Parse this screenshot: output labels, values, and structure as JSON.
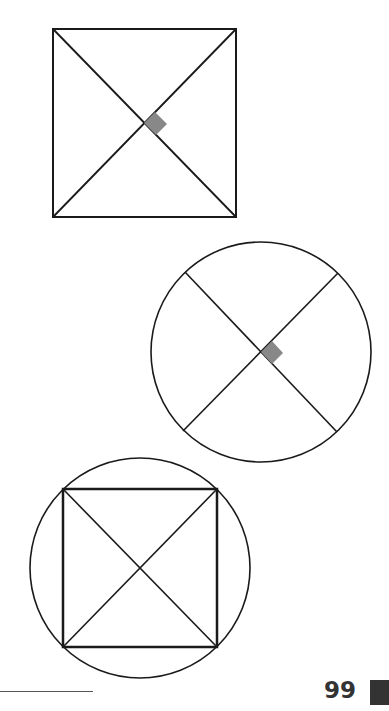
{
  "page": {
    "number": "99",
    "colors": {
      "stroke": "#1a1a1a",
      "right_angle_marker": "#888888",
      "page_tab": "#333333"
    }
  },
  "figures": [
    {
      "id": "square-with-diagonals",
      "description": "Square with both diagonals drawn; right-angle marker at intersection"
    },
    {
      "id": "circle-with-perpendicular-diameters",
      "description": "Circle with two perpendicular diameters; right-angle marker at center"
    },
    {
      "id": "square-inscribed-in-circle",
      "description": "Square inscribed in a circle with both diagonals drawn"
    }
  ]
}
